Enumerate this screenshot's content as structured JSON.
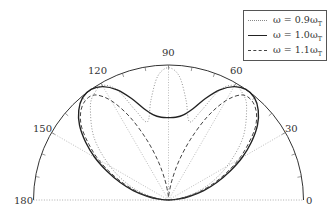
{
  "chart_data": {
    "type": "line",
    "subtype": "polar-half",
    "title": "",
    "angle_unit": "degrees",
    "theta_range": [
      0,
      180
    ],
    "r_range": [
      0,
      1
    ],
    "grid": {
      "radial_lines_deg": [
        30,
        60,
        90,
        120,
        150
      ],
      "style": "dotted"
    },
    "tick_labels": [
      "0",
      "30",
      "60",
      "90",
      "120",
      "150",
      "180"
    ],
    "tick_angles": [
      0,
      30,
      60,
      90,
      120,
      150,
      180
    ],
    "legend_position": "upper right",
    "series": [
      {
        "name": "ω = 0.9ω_T",
        "label_main": "ω = 0.9ω",
        "label_sub": "T",
        "style": "dotted",
        "color": "#888888",
        "theta": [
          0,
          10,
          20,
          30,
          40,
          50,
          55,
          60,
          65,
          70,
          75,
          80,
          85,
          90,
          95,
          100,
          105,
          110,
          115,
          120,
          125,
          130,
          140,
          150,
          160,
          170,
          180
        ],
        "r": [
          0,
          0.12,
          0.3,
          0.5,
          0.72,
          0.9,
          0.96,
          0.98,
          0.9,
          0.7,
          0.6,
          0.75,
          0.92,
          0.98,
          0.92,
          0.75,
          0.6,
          0.7,
          0.9,
          0.98,
          0.96,
          0.9,
          0.72,
          0.5,
          0.3,
          0.12,
          0
        ]
      },
      {
        "name": "ω = 1.0ω_T",
        "label_main": "ω = 1.0ω",
        "label_sub": "T",
        "style": "solid",
        "color": "#222222",
        "theta": [
          0,
          5,
          10,
          15,
          20,
          25,
          30,
          35,
          40,
          45,
          50,
          55,
          60,
          65,
          70,
          75,
          80,
          85,
          90,
          95,
          100,
          105,
          110,
          115,
          120,
          125,
          130,
          135,
          140,
          145,
          150,
          155,
          160,
          165,
          170,
          175,
          180
        ],
        "r": [
          0,
          0.07,
          0.16,
          0.27,
          0.38,
          0.5,
          0.63,
          0.75,
          0.86,
          0.94,
          0.99,
          1.0,
          0.97,
          0.9,
          0.8,
          0.7,
          0.64,
          0.615,
          0.61,
          0.615,
          0.64,
          0.7,
          0.8,
          0.9,
          0.97,
          1.0,
          0.99,
          0.94,
          0.86,
          0.75,
          0.63,
          0.5,
          0.38,
          0.27,
          0.16,
          0.07,
          0
        ]
      },
      {
        "name": "ω = 1.1ω_T",
        "label_main": "ω = 1.1ω",
        "label_sub": "T",
        "style": "dashed",
        "color": "#444444",
        "theta": [
          0,
          5,
          10,
          15,
          20,
          25,
          30,
          35,
          40,
          45,
          50,
          55,
          60,
          65,
          70,
          75,
          80,
          85,
          90,
          95,
          100,
          105,
          110,
          115,
          120,
          125,
          130,
          135,
          140,
          145,
          150,
          155,
          160,
          165,
          170,
          175,
          180
        ],
        "r": [
          0,
          0.06,
          0.14,
          0.24,
          0.35,
          0.47,
          0.6,
          0.72,
          0.84,
          0.92,
          0.96,
          0.95,
          0.85,
          0.68,
          0.48,
          0.3,
          0.15,
          0.05,
          0.02,
          0.05,
          0.15,
          0.3,
          0.48,
          0.68,
          0.85,
          0.95,
          0.96,
          0.92,
          0.84,
          0.72,
          0.6,
          0.47,
          0.35,
          0.24,
          0.14,
          0.06,
          0
        ]
      }
    ]
  },
  "legend": {
    "items": [
      {
        "main": "ω = 0.9ω",
        "sub": "T"
      },
      {
        "main": "ω = 1.0ω",
        "sub": "T"
      },
      {
        "main": "ω = 1.1ω",
        "sub": "T"
      }
    ]
  },
  "axis_labels": {
    "a0": "0",
    "a30": "30",
    "a60": "60",
    "a90": "90",
    "a120": "120",
    "a150": "150",
    "a180": "180"
  }
}
